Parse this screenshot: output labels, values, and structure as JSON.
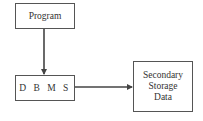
{
  "diagram": {
    "nodes": [
      {
        "id": "program",
        "label": "Program"
      },
      {
        "id": "dbms",
        "label": "D B M S"
      },
      {
        "id": "storage",
        "label_lines": [
          "Secondary",
          "Storage",
          "Data"
        ]
      }
    ],
    "edges": [
      {
        "from": "program",
        "to": "dbms",
        "direction": "down"
      },
      {
        "from": "dbms",
        "to": "storage",
        "direction": "right"
      }
    ],
    "colors": {
      "line": "#444444",
      "border": "#555555",
      "text": "#333333",
      "background": "#ffffff"
    }
  }
}
